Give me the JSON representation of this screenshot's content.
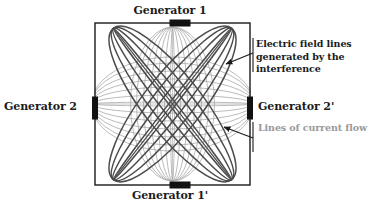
{
  "figure": {
    "background_color": "#ffffff",
    "enclosure": {
      "name": "chamber-boundary",
      "x": 95,
      "y": 23,
      "width": 155,
      "height": 162,
      "stroke_color": "#1a1a1a",
      "stroke_width": 1.4
    },
    "colors": {
      "field_line_dark": "#4b4b4b",
      "field_line_dark_accent": "#3a3a3a",
      "current_line_gray": "#a9a9a9",
      "current_line_gray_light": "#b8b8b8",
      "electrode_black": "#111111",
      "label_text": "#1b1b1b",
      "gray_label_text": "#9a9a9a",
      "arrow": "#1a1a1a"
    },
    "electrodes": [
      {
        "name": "electrode-generator-1",
        "position": "top",
        "cx": 180,
        "cy": 23,
        "w": 21,
        "h": 7
      },
      {
        "name": "electrode-generator-1p",
        "position": "bottom",
        "cx": 180,
        "cy": 185,
        "w": 21,
        "h": 7
      },
      {
        "name": "electrode-generator-2",
        "position": "left",
        "cx": 95,
        "cy": 108,
        "w": 6,
        "h": 23
      },
      {
        "name": "electrode-generator-2p",
        "position": "right",
        "cx": 250,
        "cy": 108,
        "w": 6,
        "h": 23
      }
    ]
  },
  "labels": {
    "generator_1": "Generator 1",
    "generator_1_prime": "Generator 1'",
    "generator_2": "Generator 2",
    "generator_2_prime": "Generator 2'"
  },
  "annotations": {
    "electric_field": {
      "text": "Electric field lines generated by the interference",
      "color": "#1b1b1b",
      "bold": true,
      "arrow_from": {
        "x": 253,
        "y": 53
      },
      "arrow_to": {
        "x": 226,
        "y": 64
      }
    },
    "current_flow": {
      "text": "Lines of current flow",
      "color": "#9a9a9a",
      "bold": true,
      "arrow_from": {
        "x": 253,
        "y": 138
      },
      "arrow_to": {
        "x": 224,
        "y": 127
      }
    }
  },
  "chart_data": {
    "type": "diagram",
    "center": {
      "x": 172.5,
      "y": 104
    },
    "families": [
      {
        "name": "vertical-current-lines",
        "description": "Lines of current flow between Generator 1 (top) and Generator 1' (bottom)",
        "color": "#a9a9a9",
        "stroke_width": 0.8,
        "orientation_deg": 90,
        "semi_major": 81,
        "half_widths": [
          2,
          9,
          17,
          25,
          33,
          41,
          47
        ]
      },
      {
        "name": "horizontal-current-lines",
        "description": "Lines of current flow between Generator 2 (left) and Generator 2' (right)",
        "color": "#a9a9a9",
        "stroke_width": 0.8,
        "orientation_deg": 0,
        "semi_major": 77,
        "half_widths": [
          2,
          8,
          15,
          22,
          29,
          36,
          42
        ]
      },
      {
        "name": "diagonal-field-lines-ne",
        "description": "Electric field lines generated by the interference, tilted +38 degrees",
        "color": "#4b4b4b",
        "stroke_width": 1.5,
        "orientation_deg": -38,
        "semi_major": 96,
        "half_widths": [
          3,
          11,
          20,
          29
        ]
      },
      {
        "name": "diagonal-field-lines-nw",
        "description": "Electric field lines generated by the interference, tilted -38 degrees",
        "color": "#4b4b4b",
        "stroke_width": 1.5,
        "orientation_deg": 38,
        "semi_major": 96,
        "half_widths": [
          3,
          11,
          20,
          29
        ]
      }
    ]
  }
}
